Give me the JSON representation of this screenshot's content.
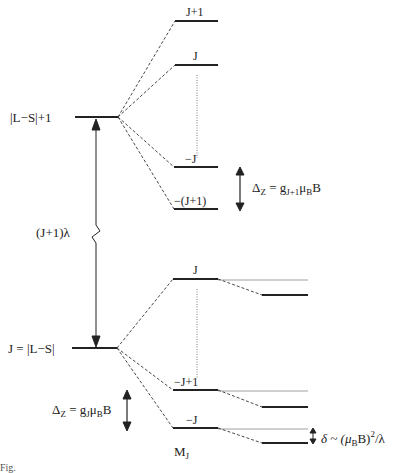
{
  "diagram": {
    "upper_level_label": "|L−S|+1",
    "lower_level_label": "J = |L−S|",
    "gap_label": "(J+1)λ",
    "upper_sublevels": [
      "J+1",
      "J",
      "−J",
      "−(J+1)"
    ],
    "lower_sublevels": [
      "J",
      "−J+1",
      "−J"
    ],
    "upper_zeeman": {
      "delta": "Δ",
      "delta_sub": "Z",
      "eq": " = g",
      "g_sub": "J+1",
      "mu": "μ",
      "mu_sub": "B",
      "tail": "B"
    },
    "lower_zeeman": {
      "delta": "Δ",
      "delta_sub": "Z",
      "eq": " = g",
      "g_sub": "J",
      "mu": "μ",
      "mu_sub": "B",
      "tail": "B"
    },
    "shift": {
      "symbol": "δ ~ (μ",
      "mu_sub": "B",
      "mid": "B)",
      "sup": "2",
      "tail": "/λ"
    },
    "mj_label": {
      "main": "M",
      "sub": "J"
    },
    "caption": "Fig."
  }
}
